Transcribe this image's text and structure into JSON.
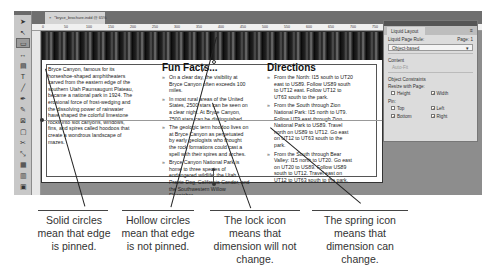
{
  "window": {
    "doc_tab": "*bryce_brochure.indd @ 65%",
    "close_glyph": "×"
  },
  "ruler": {
    "ticks": [
      "0",
      "50",
      "100",
      "150",
      "200",
      "250",
      "300",
      "350",
      "400",
      "450",
      "500",
      "550",
      "600",
      "650",
      "700",
      "750",
      "800",
      "850",
      "900",
      "950",
      "1000"
    ]
  },
  "toolbar": {
    "tools": [
      {
        "name": "selection-tool",
        "glyph": "➤"
      },
      {
        "name": "direct-selection-tool",
        "glyph": "↖"
      },
      {
        "name": "page-tool",
        "glyph": "▭",
        "active": true
      },
      {
        "name": "gap-tool",
        "glyph": "↔"
      },
      {
        "name": "content-collector-tool",
        "glyph": "▤"
      },
      {
        "name": "type-tool",
        "glyph": "T"
      },
      {
        "name": "line-tool",
        "glyph": "╱"
      },
      {
        "name": "pen-tool",
        "glyph": "✒"
      },
      {
        "name": "pencil-tool",
        "glyph": "✎"
      },
      {
        "name": "rectangle-frame-tool",
        "glyph": "⊠"
      },
      {
        "name": "rectangle-tool",
        "glyph": "▢"
      },
      {
        "name": "scissors-tool",
        "glyph": "✂"
      },
      {
        "name": "free-transform-tool",
        "glyph": "⤡"
      },
      {
        "name": "gradient-swatch-tool",
        "glyph": "▦"
      },
      {
        "name": "gradient-feather-tool",
        "glyph": "▥"
      },
      {
        "name": "note-tool",
        "glyph": "▣"
      },
      {
        "name": "eyedropper-tool",
        "glyph": "⁄"
      },
      {
        "name": "hand-tool",
        "glyph": "◎"
      }
    ]
  },
  "page": {
    "intro_text": "Bryce Canyon, famous for its horseshoe-shaped amphitheaters carved from the eastern edge of the southern Utah Paunsaugunt Plateau, became a national park in 1924. The erosional force of frost-wedging and the dissolving power of rainwater have shaped the colorful limestone rocks into slot canyons, windows, fins, and spires called hoodoos that create a wondrous landscape of mazes.",
    "fun_facts": {
      "heading": "Fun Facts...",
      "items": [
        "On a clear day, the visibility at Bryce Canyon often exceeds 100 miles.",
        "In most rural areas of the United States, 2500 stars can be seen on a clear night. At Bryce Canyon, 7500 stars can be distinguished.",
        "The geologic term hoodoo lives on at Bryce Canyon as perpetuated by early geologists who thought the rock formations could cast a spell with their spires and arches.",
        "Bryce Canyon National Park is home to three species of endangered wildlife: the Utah Prairie Dog, California Condor, and the Southwestern Willow Flycatcher."
      ]
    },
    "directions": {
      "heading": "Directions",
      "items": [
        "From the North: I15 south to UT20 east to US89. Follow US89 south to UT12 east. Follow UT12 to UT63 south to the park.",
        "From the South through Zion National Park: I15 north to UT9. Follow UT9 east through Zion National Park to US89. Travel north on US89 to UT12. Go east on UT12 to UT63 south to the park.",
        "From the South through Bear Valley: I15 north to UT20. Go east on UT20 to US89. Follow US89 south to UT12. Travel east on UT12 to UT63 south to the park."
      ]
    }
  },
  "liquid_layout_panel": {
    "tab_label": "Liquid Layout",
    "menu_glyph": "≡",
    "page_rule_label": "Liquid Page Rule:",
    "page_label": "Page: 1",
    "rule_value": "Object-based",
    "dropdown_glyph": "▾",
    "content_label": "Content",
    "auto_fit_label": "Auto-Fit",
    "constraints_label": "Object Constraints",
    "resize_label": "Resize with Page:",
    "height_label": "Height",
    "height_checked": false,
    "width_label": "Width",
    "width_checked": true,
    "pin_label": "Pin:",
    "top_label": "Top",
    "top_checked": false,
    "left_label": "Left",
    "left_checked": true,
    "bottom_label": "Bottom",
    "bottom_checked": true,
    "right_label": "Right",
    "right_checked": true,
    "check_glyph": "✓"
  },
  "captions": [
    "Solid circles mean that edge is pinned.",
    "Hollow circles mean that edge is not pinned.",
    "The lock icon means that dimension will not change.",
    "The spring icon means that dimension can change."
  ]
}
